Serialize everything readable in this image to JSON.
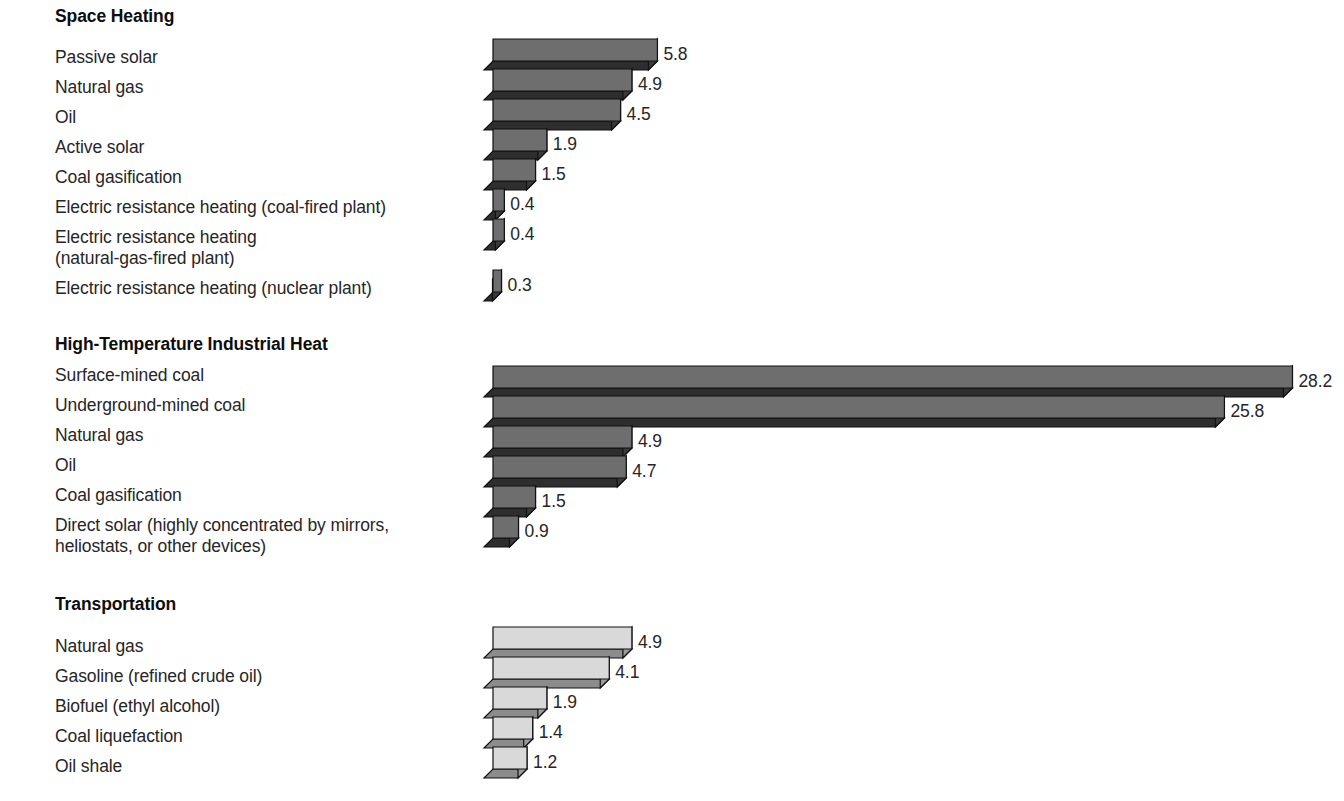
{
  "chart_data": {
    "type": "bar",
    "title": "",
    "subtitle": "",
    "xlabel": "",
    "ylabel": "",
    "orientation": "horizontal",
    "grid": false,
    "legend": "none",
    "value_format": "one-decimal",
    "groups": [
      {
        "name": "Space Heating",
        "fill": "#6e6e6e",
        "categories": [
          "Passive solar",
          "Natural gas",
          "Oil",
          "Active solar",
          "Coal gasification",
          "Electric resistance heating (coal-fired plant)",
          "Electric resistance heating\n(natural-gas-fired plant)",
          "Electric resistance heating (nuclear plant)"
        ],
        "values": [
          5.8,
          4.9,
          4.5,
          1.9,
          1.5,
          0.4,
          0.4,
          0.3
        ]
      },
      {
        "name": "High-Temperature Industrial Heat",
        "fill": "#6e6e6e",
        "categories": [
          "Surface-mined coal",
          "Underground-mined coal",
          "Natural gas",
          "Oil",
          "Coal gasification",
          "Direct solar (highly concentrated by mirrors,\nheliostats, or other devices)"
        ],
        "values": [
          28.2,
          25.8,
          4.9,
          4.7,
          1.5,
          0.9
        ]
      },
      {
        "name": "Transportation",
        "fill": "#d9d9d9",
        "categories": [
          "Natural gas",
          "Gasoline (refined crude oil)",
          "Biofuel (ethyl alcohol)",
          "Coal liquefaction",
          "Oil shale"
        ],
        "values": [
          4.9,
          4.1,
          1.9,
          1.4,
          1.2
        ]
      }
    ],
    "labels_flat": [
      "5.8",
      "4.9",
      "4.5",
      "1.9",
      "1.5",
      "0.4",
      "0.4",
      "0.3",
      "28.2",
      "25.8",
      "4.9",
      "4.7",
      "1.5",
      "0.9",
      "4.9",
      "4.1",
      "1.9",
      "1.4",
      "1.2"
    ],
    "colors": {
      "dark_front": "#6e6e6e",
      "dark_side": "#3a3a3a",
      "dark_bottom": "#2e2e2e",
      "light_front": "#d9d9d9",
      "light_side": "#9a9a9a",
      "light_bottom": "#8c8c8c",
      "outline": "#111111",
      "text": "#262626",
      "background": "#ffffff"
    },
    "scale": {
      "origin_x_px": 493,
      "px_per_unit": 28.35,
      "bar_height_px": 22,
      "depth_px": 9
    }
  }
}
